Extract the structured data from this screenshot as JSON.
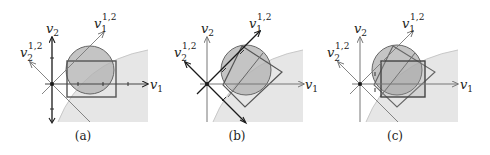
{
  "figure": {
    "panels": [
      {
        "id": "a",
        "caption": "(a)",
        "axis_labels": {
          "x_base": "v",
          "x_sub": "1",
          "y_base": "v",
          "y_sub": "2"
        },
        "rotated_axis_labels": {
          "d1_base": "v",
          "d1_sub": "1",
          "d1_sup": "1,2",
          "d2_base": "v",
          "d2_sub": "2",
          "d2_sup": "1,2"
        },
        "box_type": "axis-aligned rectangle"
      },
      {
        "id": "b",
        "caption": "(b)",
        "axis_labels": {
          "x_base": "v",
          "x_sub": "1",
          "y_base": "v",
          "y_sub": "2"
        },
        "rotated_axis_labels": {
          "d1_base": "v",
          "d1_sub": "1",
          "d1_sup": "1,2",
          "d2_base": "v",
          "d2_sub": "2",
          "d2_sup": "1,2"
        },
        "box_type": "rotated rectangle"
      },
      {
        "id": "c",
        "caption": "(c)",
        "axis_labels": {
          "x_base": "v",
          "x_sub": "1",
          "y_base": "v",
          "y_sub": "2"
        },
        "rotated_axis_labels": {
          "d1_base": "v",
          "d1_sub": "1",
          "d1_sup": "1,2",
          "d2_base": "v",
          "d2_sub": "2",
          "d2_sup": "1,2"
        },
        "box_type": "intersection of axis-aligned and rotated rectangles"
      }
    ],
    "colors": {
      "circle_fill": "#b0b0b0",
      "circle_stroke": "#666666",
      "region_fill": "#e6e6e6",
      "region_stroke": "#c8c8c8",
      "box_stroke": "#555555",
      "axis_dark": "#1a1a1a",
      "axis_light": "#777777"
    }
  }
}
